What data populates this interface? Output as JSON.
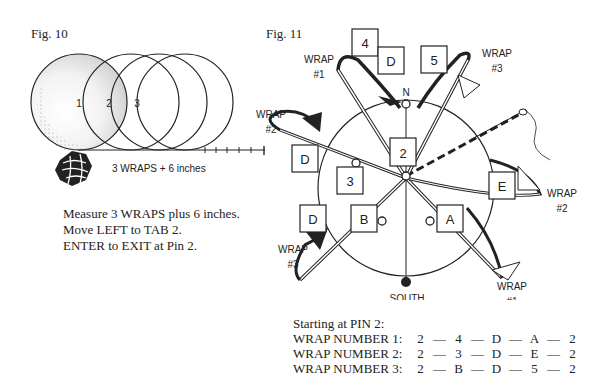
{
  "fig10": {
    "title": "Fig. 10",
    "circle_labels": [
      "1",
      "2",
      "3"
    ],
    "measure_label": "3 WRAPS + 6 inches",
    "instructions": [
      "Measure 3 WRAPS plus 6 inches.",
      "Move LEFT to TAB 2.",
      "ENTER to EXIT at Pin 2."
    ]
  },
  "fig11": {
    "title": "Fig. 11",
    "north_label": "N",
    "south_label": "SOUTH",
    "boxes": {
      "center": "2",
      "top_left": "4",
      "top_d": "D",
      "top_right": "5",
      "left_d_upper": "D",
      "left_3": "3",
      "left_d_lower": "D",
      "b": "B",
      "a": "A",
      "e": "E"
    },
    "wrap_labels": {
      "wrap1_top": {
        "line1": "WRAP",
        "line2": "#1"
      },
      "wrap3_top": {
        "line1": "WRAP",
        "line2": "#3"
      },
      "wrap2_left": {
        "line1": "WRAP",
        "line2": "#2"
      },
      "wrap2_right": {
        "line1": "WRAP",
        "line2": "#2"
      },
      "wrap3_bottom": {
        "line1": "WRAP",
        "line2": "#3"
      },
      "wrap1_bottom": {
        "line1": "WRAP",
        "line2": "#1"
      }
    }
  },
  "sequence": {
    "heading": "Starting at PIN 2:",
    "rows": [
      {
        "label": "WRAP NUMBER 1:",
        "steps": [
          "2",
          "4",
          "D",
          "A",
          "2"
        ]
      },
      {
        "label": "WRAP NUMBER 2:",
        "steps": [
          "2",
          "3",
          "D",
          "E",
          "2"
        ]
      },
      {
        "label": "WRAP NUMBER 3:",
        "steps": [
          "2",
          "B",
          "D",
          "5",
          "2"
        ]
      }
    ],
    "separator": "—"
  }
}
